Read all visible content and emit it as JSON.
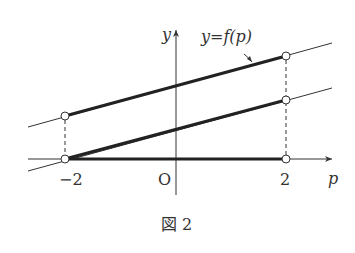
{
  "figure": {
    "caption": "図 2",
    "function_label": "y=f(p)",
    "axes": {
      "x_label": "p",
      "y_label": "y",
      "origin_label": "O",
      "ticks": [
        {
          "value": -2,
          "label": "−2"
        },
        {
          "value": 2,
          "label": "2"
        }
      ]
    },
    "colors": {
      "ink": "#333333",
      "background": "#ffffff"
    }
  },
  "diagram": {
    "elements": [
      {
        "type": "line",
        "role": "upper thin line",
        "style": "thin"
      },
      {
        "type": "line",
        "role": "middle thin line",
        "style": "thin"
      },
      {
        "type": "segment",
        "role": "upper thick segment p in (-2,2)",
        "style": "thick"
      },
      {
        "type": "segment",
        "role": "middle thick segment p in (-2,2)",
        "style": "thick"
      },
      {
        "type": "segment",
        "role": "p-axis thick segment p in (-2,2)",
        "style": "thick"
      },
      {
        "type": "point",
        "role": "open circle (-2, upper)",
        "open": true
      },
      {
        "type": "point",
        "role": "open circle (-2, 0)",
        "open": true
      },
      {
        "type": "point",
        "role": "open circle (2, upper)",
        "open": true
      },
      {
        "type": "point",
        "role": "open circle (2, middle)",
        "open": true
      },
      {
        "type": "point",
        "role": "open circle (2, 0)",
        "open": true
      },
      {
        "type": "dashed",
        "role": "vertical guide at p=-2"
      },
      {
        "type": "dashed",
        "role": "vertical guide at p=2"
      }
    ]
  }
}
